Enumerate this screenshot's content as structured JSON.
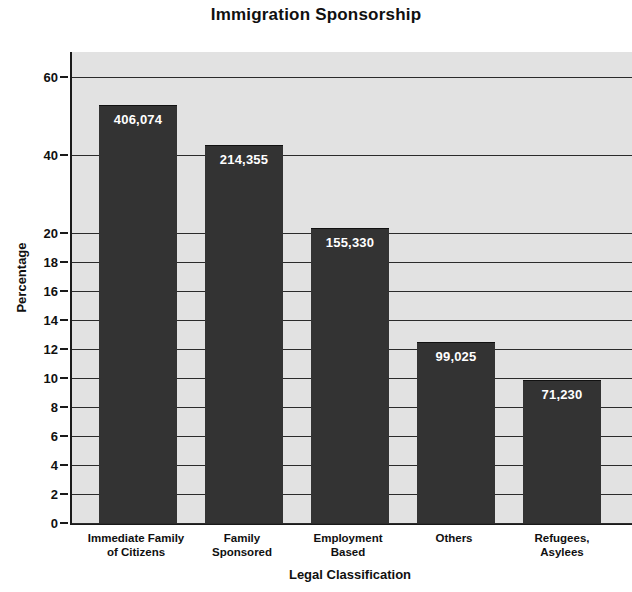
{
  "chart_data": {
    "type": "bar",
    "title": "Immigration Sponsorship",
    "xlabel": "Legal Classification",
    "ylabel": "Percentage",
    "categories": [
      "Immediate Family\nof Citizens",
      "Family\nSponsored",
      "Employment\nBased",
      "Others",
      "Refugees,\nAsylees"
    ],
    "category_lines": [
      [
        "Immediate Family",
        "of Citizens"
      ],
      [
        "Family",
        "Sponsored"
      ],
      [
        "Employment",
        "Based"
      ],
      [
        "Others"
      ],
      [
        "Refugees,",
        "Asylees"
      ]
    ],
    "data_labels": [
      "406,074",
      "214,355",
      "155,330",
      "99,025",
      "71,230"
    ],
    "counts": [
      406074,
      214355,
      155330,
      99025,
      71230
    ],
    "values": [
      42.5,
      22.4,
      16.2,
      10.4,
      7.5
    ],
    "ytick_labels": [
      "0",
      "2",
      "4",
      "6",
      "8",
      "10",
      "12",
      "14",
      "16",
      "18",
      "20",
      "40",
      "60"
    ],
    "ytick_values": [
      0,
      2,
      4,
      6,
      8,
      10,
      12,
      14,
      16,
      18,
      20,
      40,
      60
    ],
    "ylim": [
      0,
      68
    ],
    "grid": true,
    "legend": "none",
    "note": "Y axis uses a broken (non-linear) scale: linear 0-20 in steps of 2, then compressed 20-40-60.",
    "colors": {
      "bar": "#333333",
      "plot_background": "#e2e2e2",
      "axis": "#1a1a1a",
      "gridline": "#2b2b2b",
      "value_label": "#ffffff",
      "text": "#101010"
    }
  },
  "layout": {
    "ytick_positions_px": [
      471,
      442,
      413,
      384,
      355,
      326,
      297,
      268,
      239,
      210,
      181,
      103,
      25
    ],
    "bars_px": [
      {
        "left": 27,
        "width": 78,
        "top": 53
      },
      {
        "left": 133,
        "width": 78,
        "top": 93
      },
      {
        "left": 239,
        "width": 78,
        "top": 176
      },
      {
        "left": 345,
        "width": 78,
        "top": 290
      },
      {
        "left": 451,
        "width": 78,
        "top": 328
      }
    ],
    "category_label_px": [
      {
        "left": 70,
        "width": 132
      },
      {
        "left": 176,
        "width": 132
      },
      {
        "left": 282,
        "width": 132
      },
      {
        "left": 388,
        "width": 132
      },
      {
        "left": 494,
        "width": 136
      }
    ]
  }
}
